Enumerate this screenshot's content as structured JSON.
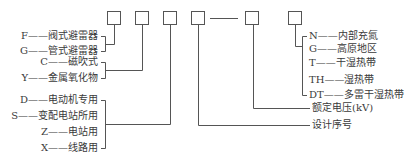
{
  "diagram": {
    "boxes": 6,
    "groups": [
      {
        "name": "product-type",
        "items": [
          {
            "code": "F",
            "label": "阀式避雷器"
          },
          {
            "code": "G",
            "label": "管式避雷器"
          }
        ]
      },
      {
        "name": "structure",
        "items": [
          {
            "code": "C",
            "label": "磁吹式"
          },
          {
            "code": "Y",
            "label": "金属氧化物"
          }
        ]
      },
      {
        "name": "usage",
        "items": [
          {
            "code": "D",
            "label": "电动机专用"
          },
          {
            "code": "S",
            "label": "变配电站所用"
          },
          {
            "code": "Z",
            "label": "电站用"
          },
          {
            "code": "X",
            "label": "线路用"
          }
        ]
      },
      {
        "name": "environment",
        "items": [
          {
            "code": "N",
            "label": "内部充氮"
          },
          {
            "code": "G",
            "label": "高原地区"
          },
          {
            "code": "T",
            "label": "干湿热带"
          },
          {
            "code": "TH",
            "label": "湿热带"
          },
          {
            "code": "DT",
            "label": "多雷干湿热带"
          }
        ]
      }
    ],
    "rated_voltage": "额定电压(kV)",
    "design_serial": "设计序号",
    "dash": "——"
  }
}
